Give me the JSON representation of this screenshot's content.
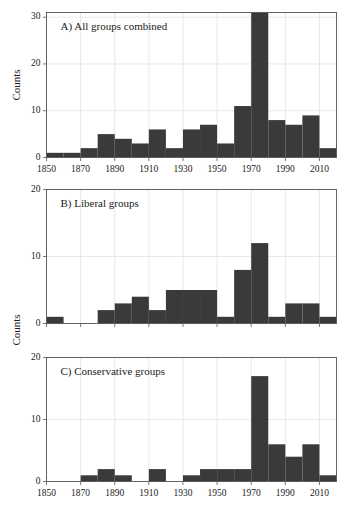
{
  "figure": {
    "width": 350,
    "height": 515,
    "y_axis_title": "Counts",
    "bar_color": "#3a3a3a",
    "grid_color": "#d8d8d8",
    "frame_color": "#555555",
    "background": "#ffffff"
  },
  "chart_data": [
    {
      "type": "bar",
      "panel": "A",
      "title": "A) All groups combined",
      "xlabel": "",
      "ylabel": "Counts",
      "xlim": [
        1850,
        2020
      ],
      "ylim": [
        0,
        31
      ],
      "ytick_values": [
        0,
        10,
        20,
        30
      ],
      "ytick_labels": [
        "0",
        "10",
        "20",
        "30"
      ],
      "xtick_values": [
        1850,
        1870,
        1890,
        1910,
        1930,
        1950,
        1970,
        1990,
        2010
      ],
      "xtick_labels": [
        "1850",
        "1870",
        "1890",
        "1910",
        "1930",
        "1950",
        "1970",
        "1990",
        "2010"
      ],
      "grid": true,
      "bin_width": 10,
      "categories": [
        "1850",
        "1860",
        "1870",
        "1880",
        "1890",
        "1900",
        "1910",
        "1920",
        "1930",
        "1940",
        "1950",
        "1960",
        "1970",
        "1980",
        "1990",
        "2000",
        "2010"
      ],
      "values": [
        1,
        1,
        2,
        5,
        4,
        3,
        6,
        2,
        6,
        7,
        3,
        11,
        31,
        8,
        7,
        9,
        2
      ]
    },
    {
      "type": "bar",
      "panel": "B",
      "title": "B) Liberal groups",
      "xlabel": "",
      "ylabel": "Counts",
      "xlim": [
        1850,
        2020
      ],
      "ylim": [
        0,
        20
      ],
      "ytick_values": [
        0,
        10,
        20
      ],
      "ytick_labels": [
        "0",
        "10",
        "20"
      ],
      "xtick_values": [
        1850,
        1870,
        1890,
        1910,
        1930,
        1950,
        1970,
        1990,
        2010
      ],
      "xtick_labels": [
        "1850",
        "1870",
        "1890",
        "1910",
        "1930",
        "1950",
        "1970",
        "1990",
        "2010"
      ],
      "grid": true,
      "bin_width": 10,
      "categories": [
        "1850",
        "1860",
        "1870",
        "1880",
        "1890",
        "1900",
        "1910",
        "1920",
        "1930",
        "1940",
        "1950",
        "1960",
        "1970",
        "1980",
        "1990",
        "2000",
        "2010"
      ],
      "values": [
        1,
        0,
        0,
        2,
        3,
        4,
        2,
        5,
        5,
        5,
        1,
        8,
        12,
        1,
        3,
        3,
        1
      ]
    },
    {
      "type": "bar",
      "panel": "C",
      "title": "C) Conservative groups",
      "xlabel": "",
      "ylabel": "Counts",
      "xlim": [
        1850,
        2020
      ],
      "ylim": [
        0,
        20
      ],
      "ytick_values": [
        0,
        10,
        20
      ],
      "ytick_labels": [
        "0",
        "10",
        "20"
      ],
      "xtick_values": [
        1850,
        1870,
        1890,
        1910,
        1930,
        1950,
        1970,
        1990,
        2010
      ],
      "xtick_labels": [
        "1850",
        "1870",
        "1890",
        "1910",
        "1930",
        "1950",
        "1970",
        "1990",
        "2010"
      ],
      "grid": true,
      "bin_width": 10,
      "categories": [
        "1850",
        "1860",
        "1870",
        "1880",
        "1890",
        "1900",
        "1910",
        "1920",
        "1930",
        "1940",
        "1950",
        "1960",
        "1970",
        "1980",
        "1990",
        "2000",
        "2010"
      ],
      "values": [
        0,
        0,
        1,
        2,
        1,
        0,
        2,
        0,
        1,
        2,
        2,
        2,
        17,
        6,
        4,
        6,
        1
      ]
    }
  ]
}
